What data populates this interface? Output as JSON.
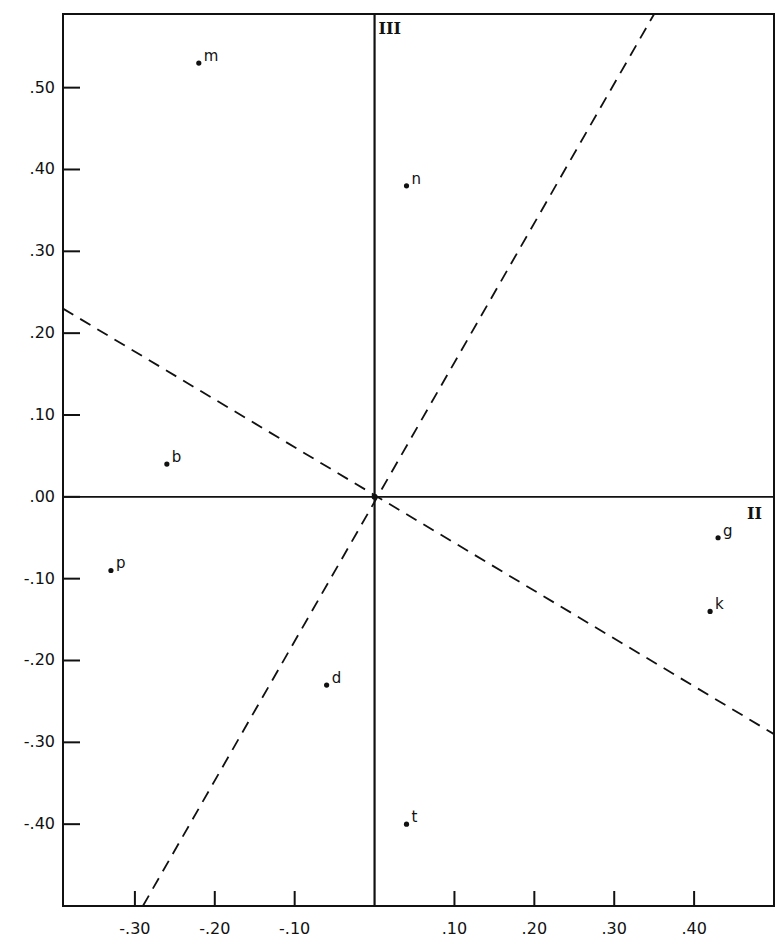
{
  "chart_data": {
    "type": "scatter",
    "title": "",
    "xlabel": "II",
    "ylabel": "III",
    "xlim": [
      -0.39,
      0.5
    ],
    "ylim": [
      -0.5,
      0.59
    ],
    "grid": false,
    "legend": null,
    "x_ticks": [
      -0.3,
      -0.2,
      -0.1,
      0.1,
      0.2,
      0.3,
      0.4
    ],
    "x_tick_labels": [
      "-.30",
      "-.20",
      "-.10",
      ".10",
      ".20",
      ".30",
      ".40"
    ],
    "y_ticks": [
      0.5,
      0.4,
      0.3,
      0.2,
      0.1,
      0.0,
      -0.1,
      -0.2,
      -0.3,
      -0.4
    ],
    "y_tick_labels": [
      ".50",
      ".40",
      ".30",
      ".20",
      ".10",
      ".00",
      "-.10",
      "-.20",
      "-.30",
      "-.40"
    ],
    "points": [
      {
        "label": "m",
        "x": -0.22,
        "y": 0.53
      },
      {
        "label": "n",
        "x": 0.04,
        "y": 0.38
      },
      {
        "label": "b",
        "x": -0.26,
        "y": 0.04
      },
      {
        "label": "p",
        "x": -0.33,
        "y": -0.09
      },
      {
        "label": "d",
        "x": -0.06,
        "y": -0.23
      },
      {
        "label": "t",
        "x": 0.04,
        "y": -0.4
      },
      {
        "label": "g",
        "x": 0.43,
        "y": -0.05
      },
      {
        "label": "k",
        "x": 0.42,
        "y": -0.14
      }
    ],
    "axes_lines": {
      "vertical_axis_label": "III",
      "horizontal_axis_label": "II"
    },
    "rotated_axes_dashed": [
      {
        "name": "steep",
        "from": [
          -0.29,
          -0.5
        ],
        "to": [
          0.35,
          0.59
        ]
      },
      {
        "name": "shallow",
        "from": [
          -0.39,
          0.23
        ],
        "to": [
          0.5,
          -0.29
        ]
      }
    ]
  },
  "colors": {
    "ink": "#111111",
    "background": "#ffffff"
  }
}
